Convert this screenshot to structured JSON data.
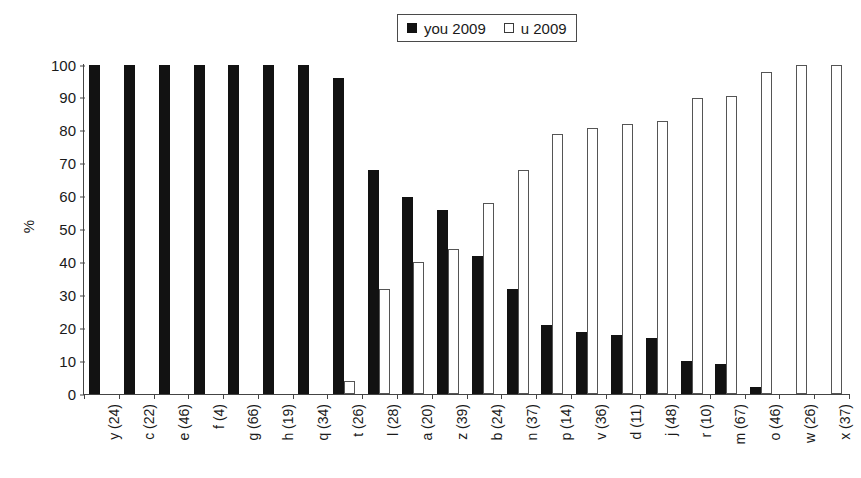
{
  "legend": {
    "entries": [
      {
        "label": "you 2009",
        "marker": "filled-square-icon",
        "color": "#121212"
      },
      {
        "label": "u 2009",
        "marker": "hollow-square-icon",
        "color": "#ffffff"
      }
    ]
  },
  "axes": {
    "y_title": "%",
    "y_ticks": [
      "0",
      "10",
      "20",
      "30",
      "40",
      "50",
      "60",
      "70",
      "80",
      "90",
      "100"
    ]
  },
  "chart_data": {
    "type": "bar",
    "title": "",
    "xlabel": "",
    "ylabel": "%",
    "ylim": [
      0,
      100
    ],
    "ytick_step": 10,
    "grid": false,
    "legend_position": "top-right",
    "categories": [
      "y (24)",
      "c (22)",
      "e (46)",
      "f (4)",
      "g (66)",
      "h (19)",
      "q (34)",
      "t (26)",
      "l (28)",
      "a (20)",
      "z (39)",
      "b (24)",
      "n (37)",
      "p (14)",
      "v (36)",
      "d (11)",
      "j (48)",
      "r (10)",
      "m (67)",
      "o (46)",
      "w (26)",
      "x (37)"
    ],
    "series": [
      {
        "name": "you 2009",
        "color": "#121212",
        "values": [
          100,
          100,
          100,
          100,
          100,
          100,
          100,
          96,
          68,
          60,
          56,
          42,
          32,
          21,
          19,
          18,
          17,
          10,
          9,
          2,
          0,
          0
        ]
      },
      {
        "name": "u 2009",
        "color": "#ffffff",
        "values": [
          0,
          0,
          0,
          0,
          0,
          0,
          0,
          4,
          32,
          40,
          44,
          58,
          68,
          79,
          81,
          82,
          83,
          90,
          90.5,
          98,
          100,
          100
        ]
      }
    ]
  }
}
